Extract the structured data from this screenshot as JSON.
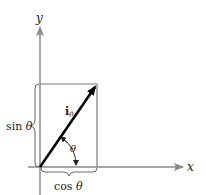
{
  "diagram": {
    "axes": {
      "x_label": "x",
      "y_label": "y",
      "axis_color": "#8a8a8a"
    },
    "vector": {
      "label_main": "i",
      "label_sub": "θ",
      "color": "#000000"
    },
    "angle": {
      "label": "θ"
    },
    "rectangle": {
      "color": "#7a7a7a"
    },
    "braces": {
      "vertical_label_prefix": "sin ",
      "vertical_label_var": "θ",
      "horizontal_label_prefix": "cos ",
      "horizontal_label_var": "θ"
    }
  }
}
